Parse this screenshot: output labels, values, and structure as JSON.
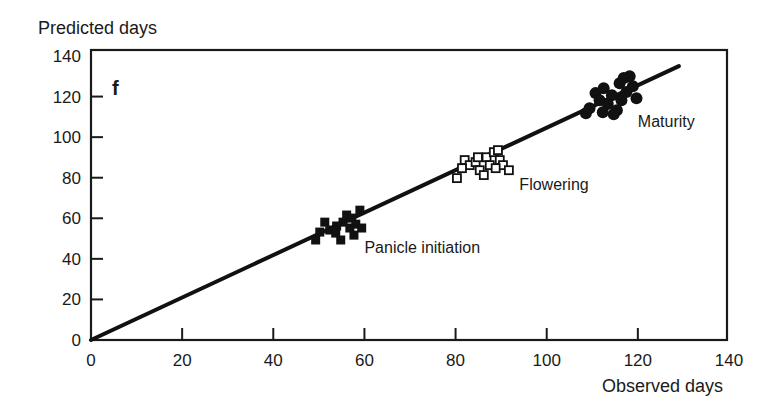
{
  "chart_data": {
    "type": "scatter",
    "title": "",
    "panel_label": "f",
    "xlabel": "Observed days",
    "ylabel": "Predicted days",
    "xlim": [
      0,
      140
    ],
    "ylim": [
      0,
      140
    ],
    "xticks": [
      0,
      20,
      40,
      60,
      80,
      100,
      120,
      140
    ],
    "yticks": [
      0,
      20,
      40,
      60,
      80,
      100,
      120,
      140
    ],
    "grid": false,
    "legend": "none",
    "series": [
      {
        "name": "Panicle initiation",
        "marker": "filled-square",
        "label_anchor": [
          60,
          43
        ],
        "points": [
          [
            49.3,
            49.3
          ],
          [
            50.2,
            53.2
          ],
          [
            51.3,
            58.1
          ],
          [
            52.4,
            54.2
          ],
          [
            53.7,
            52.7
          ],
          [
            54.8,
            49.3
          ],
          [
            55.3,
            58.1
          ],
          [
            56.1,
            61.6
          ],
          [
            56.8,
            55.2
          ],
          [
            57.7,
            51.7
          ],
          [
            58.1,
            57.1
          ],
          [
            59.0,
            64.0
          ],
          [
            59.4,
            55.2
          ],
          [
            53.9,
            56.2
          ],
          [
            57.2,
            60.1
          ]
        ]
      },
      {
        "name": "Flowering",
        "marker": "open-square",
        "label_anchor": [
          94,
          74
        ],
        "points": [
          [
            80.3,
            79.8
          ],
          [
            82.0,
            88.7
          ],
          [
            83.1,
            86.2
          ],
          [
            84.4,
            87.7
          ],
          [
            85.3,
            83.7
          ],
          [
            86.2,
            81.3
          ],
          [
            86.8,
            90.1
          ],
          [
            87.5,
            86.2
          ],
          [
            88.4,
            92.6
          ],
          [
            89.3,
            93.6
          ],
          [
            89.7,
            88.7
          ],
          [
            90.4,
            86.2
          ],
          [
            91.7,
            83.7
          ],
          [
            81.4,
            84.7
          ],
          [
            84.9,
            90.1
          ],
          [
            88.8,
            84.7
          ]
        ]
      },
      {
        "name": "Maturity",
        "marker": "filled-circle",
        "label_anchor": [
          120,
          105
        ],
        "points": [
          [
            108.6,
            111.8
          ],
          [
            109.4,
            114.3
          ],
          [
            110.7,
            121.7
          ],
          [
            111.6,
            118.2
          ],
          [
            112.5,
            124.1
          ],
          [
            113.4,
            116.3
          ],
          [
            114.3,
            120.7
          ],
          [
            115.4,
            113.3
          ],
          [
            116.0,
            126.6
          ],
          [
            116.4,
            118.2
          ],
          [
            117.5,
            122.2
          ],
          [
            118.2,
            130.0
          ],
          [
            118.9,
            125.1
          ],
          [
            119.7,
            119.2
          ],
          [
            116.9,
            129.1
          ],
          [
            114.7,
            111.3
          ],
          [
            112.3,
            112.3
          ]
        ]
      }
    ],
    "fit_line": {
      "from": [
        0,
        0
      ],
      "to": [
        129,
        135
      ]
    }
  }
}
